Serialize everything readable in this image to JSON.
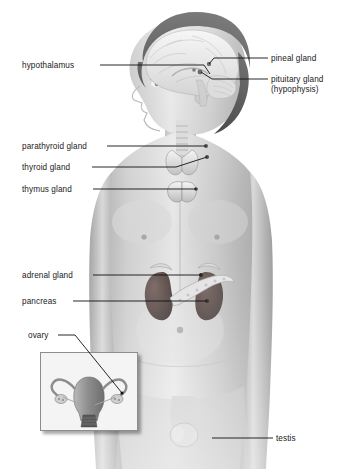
{
  "figure": {
    "background_color": "#ffffff",
    "label_color": "#1a1a1a",
    "leader_line_color": "#111111"
  },
  "labels": [
    {
      "id": "hypothalamus",
      "text": "hypothalamus",
      "side": "left",
      "x": 22,
      "y": 61
    },
    {
      "id": "pineal-gland",
      "text": "pineal gland",
      "side": "right",
      "x": 271,
      "y": 54
    },
    {
      "id": "pituitary-gland",
      "text": "pituitary gland",
      "side": "right",
      "x": 271,
      "y": 75
    },
    {
      "id": "pituitary-gland-alt",
      "text": "(hypophysis)",
      "side": "right",
      "x": 271,
      "y": 85
    },
    {
      "id": "parathyroid-gland",
      "text": "parathyroid gland",
      "side": "left",
      "x": 22,
      "y": 142
    },
    {
      "id": "thyroid-gland",
      "text": "thyroid gland",
      "side": "left",
      "x": 22,
      "y": 163
    },
    {
      "id": "thymus-gland",
      "text": "thymus gland",
      "side": "left",
      "x": 22,
      "y": 185
    },
    {
      "id": "adrenal-gland",
      "text": "adrenal gland",
      "side": "left",
      "x": 22,
      "y": 271
    },
    {
      "id": "pancreas",
      "text": "pancreas",
      "side": "left",
      "x": 22,
      "y": 297
    },
    {
      "id": "ovary",
      "text": "ovary",
      "side": "left",
      "x": 28,
      "y": 331
    },
    {
      "id": "testis",
      "text": "testis",
      "side": "right",
      "x": 276,
      "y": 434
    }
  ],
  "leaders": [
    {
      "id": "leader-hypothalamus",
      "points": "100,65 204,65 210,74"
    },
    {
      "id": "leader-pineal",
      "points": "268,58 214,58 209,64"
    },
    {
      "id": "leader-pituitary",
      "points": "268,79 212,79 201,72"
    },
    {
      "id": "leader-parathyroid",
      "points": "107,146 206,146"
    },
    {
      "id": "leader-thyroid",
      "points": "92,167 176,167 207,157"
    },
    {
      "id": "leader-thymus",
      "points": "93,189 196,189"
    },
    {
      "id": "leader-adrenal",
      "points": "93,275 201,275"
    },
    {
      "id": "leader-pancreas",
      "points": "73,301 207,301"
    },
    {
      "id": "leader-ovary",
      "points": "58,335 75,335 122,393"
    },
    {
      "id": "leader-testis",
      "points": "273,438 212,438"
    }
  ],
  "inset": {
    "id": "ovary-inset",
    "description": "uterus with fallopian tubes and ovaries",
    "border_color": "#8d8d8d",
    "x": 40,
    "y": 352,
    "width": 96,
    "height": 77
  },
  "organs": [
    {
      "id": "brain",
      "name": "brain sagittal section"
    },
    {
      "id": "pineal",
      "name": "pineal gland"
    },
    {
      "id": "pituitary",
      "name": "pituitary gland"
    },
    {
      "id": "thyroid",
      "name": "thyroid gland"
    },
    {
      "id": "parathyroid",
      "name": "parathyroid gland"
    },
    {
      "id": "thymus",
      "name": "thymus gland"
    },
    {
      "id": "adrenal",
      "name": "adrenal gland"
    },
    {
      "id": "kidneys",
      "name": "kidneys"
    },
    {
      "id": "pancreas",
      "name": "pancreas"
    },
    {
      "id": "testis",
      "name": "testis"
    }
  ]
}
